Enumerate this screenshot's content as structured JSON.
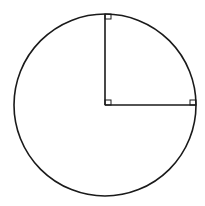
{
  "diagram": {
    "type": "geometry",
    "canvas": {
      "width": 205,
      "height": 206,
      "background": "#ffffff"
    },
    "stroke_color": "#1a1a1a",
    "circle": {
      "cx": 105,
      "cy": 105,
      "r": 91
    },
    "radii": [
      {
        "name": "vertical-radius",
        "x1": 105,
        "y1": 105,
        "x2": 105,
        "y2": 14
      },
      {
        "name": "horizontal-radius",
        "x1": 105,
        "y1": 105,
        "x2": 196,
        "y2": 105
      }
    ],
    "right_angle_markers": [
      {
        "name": "top-marker",
        "x": 105,
        "y": 14,
        "w": 6,
        "h": 5
      },
      {
        "name": "center-marker",
        "x": 105,
        "y": 100,
        "w": 6,
        "h": 5
      },
      {
        "name": "right-marker",
        "x": 190,
        "y": 100,
        "w": 6,
        "h": 5
      }
    ]
  }
}
